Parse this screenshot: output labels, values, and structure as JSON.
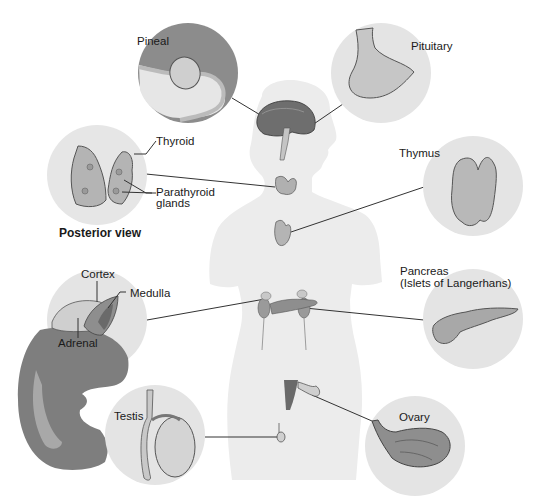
{
  "diagram": {
    "colors": {
      "background": "#ffffff",
      "silhouette": "#ececec",
      "circle_fill": "#e4e4e4",
      "organ_dark": "#7c7c7c",
      "organ_mid": "#a8a8a8",
      "organ_light": "#cfcfcf",
      "line": "#333333"
    },
    "labels": {
      "pineal": "Pineal",
      "pituitary": "Pituitary",
      "thyroid": "Thyroid",
      "parathyroid_line1": "Parathyroid",
      "parathyroid_line2": "glands",
      "posterior_view": "Posterior view",
      "thymus": "Thymus",
      "cortex": "Cortex",
      "medulla": "Medulla",
      "adrenal": "Adrenal",
      "pancreas_line1": "Pancreas",
      "pancreas_line2": "(Islets of Langerhans)",
      "testis": "Testis",
      "ovary": "Ovary"
    }
  }
}
